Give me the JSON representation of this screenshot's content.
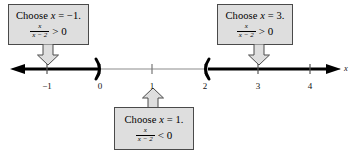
{
  "figure": {
    "type": "number-line-sign-chart",
    "axis_label": "x",
    "axis_range": [
      -1.85,
      4.85
    ],
    "ticks": [
      {
        "value": -1,
        "label": "−1"
      },
      {
        "value": 0,
        "label": "0"
      },
      {
        "value": 1,
        "label": "1"
      },
      {
        "value": 2,
        "label": "2"
      },
      {
        "value": 3,
        "label": "3"
      },
      {
        "value": 4,
        "label": "4"
      }
    ],
    "shaded_intervals": [
      {
        "from": "-infinity",
        "to": 0,
        "endpoint": "open",
        "bracket": ")"
      },
      {
        "from": 2,
        "to": "+infinity",
        "endpoint": "open",
        "bracket": "("
      }
    ],
    "colors": {
      "line_thin": "#8c8c8c",
      "line_thick": "#000000",
      "box_fill": "#dedede",
      "box_border": "#4a4a4a",
      "text": "#000000"
    }
  },
  "callouts": {
    "left": {
      "name": "choose-x-negative-one",
      "line1_prefix": "Choose ",
      "line1_var": "x",
      "line1_suffix": " = −1.",
      "numerator": "x",
      "denominator": "x − 2",
      "relation": "> 0",
      "arrow_direction": "down",
      "points_to": -1
    },
    "right": {
      "name": "choose-x-three",
      "line1_prefix": "Choose ",
      "line1_var": "x",
      "line1_suffix": " = 3.",
      "numerator": "x",
      "denominator": "x − 2",
      "relation": "> 0",
      "arrow_direction": "down",
      "points_to": 3
    },
    "bottom": {
      "name": "choose-x-one",
      "line1_prefix": "Choose ",
      "line1_var": "x",
      "line1_suffix": " = 1.",
      "numerator": "x",
      "denominator": "x − 2",
      "relation": "< 0",
      "arrow_direction": "up",
      "points_to": 1
    }
  }
}
